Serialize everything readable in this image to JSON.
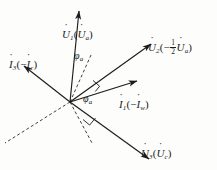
{
  "figure": {
    "type": "phasor-diagram",
    "origin": {
      "x": 70,
      "y": 102
    },
    "background_color": "#fdfdfc",
    "stroke_color": "#1c1c1c",
    "labels": {
      "u1": {
        "symbol": "U",
        "sub": "1",
        "paren_open": "(",
        "inner_symbol": "U",
        "inner_sub": "a",
        "paren_close": ")"
      },
      "u2": {
        "symbol": "U",
        "sub": "2",
        "paren_open": "(−",
        "frac_num": "1",
        "frac_den": "2",
        "inner_symbol": "U",
        "inner_sub": "a",
        "paren_close": ")"
      },
      "u3": {
        "symbol": "U",
        "sub": "3",
        "paren_open": "(",
        "inner_symbol": "U",
        "inner_sub": "c",
        "paren_close": ")"
      },
      "i1": {
        "symbol": "I",
        "sub": "1",
        "paren_open": "(−",
        "inner_symbol": "I",
        "inner_sub": "w",
        "paren_close": ")"
      },
      "i3": {
        "symbol": "I",
        "sub": "3",
        "paren_open": "(−",
        "inner_symbol": "I",
        "inner_sub": "c",
        "paren_close": ")"
      },
      "phi_upper": {
        "symbol": "φ",
        "sub": "a"
      },
      "phi_lower": {
        "symbol": "φ",
        "sub": "a"
      }
    },
    "vectors": [
      {
        "name": "U1",
        "angle_deg": 84,
        "length": 92,
        "style": "solid",
        "arrow": true
      },
      {
        "name": "U2",
        "angle_deg": 36,
        "length": 100,
        "style": "solid",
        "arrow": true
      },
      {
        "name": "I1",
        "angle_deg": 17,
        "length": 70,
        "style": "solid",
        "arrow": true
      },
      {
        "name": "U3",
        "angle_deg": -36,
        "length": 98,
        "style": "solid",
        "arrow": true
      },
      {
        "name": "I3",
        "angle_deg": 142,
        "length": 58,
        "style": "solid",
        "arrow": true
      },
      {
        "name": "phi-ref-upper",
        "angle_deg": 66,
        "length": 52,
        "style": "dashed",
        "arrow": false
      },
      {
        "name": "phi-ref-lower",
        "angle_deg": -62,
        "length": 47,
        "style": "dashed",
        "arrow": false
      },
      {
        "name": "neg-axis",
        "angle_deg": 205,
        "length": 72,
        "style": "dashed",
        "arrow": false
      }
    ],
    "right_angle_marks": [
      {
        "name": "right-angle-upper",
        "at_angle_deg": 26
      },
      {
        "name": "right-angle-lower",
        "at_angle_deg": -50
      }
    ]
  }
}
